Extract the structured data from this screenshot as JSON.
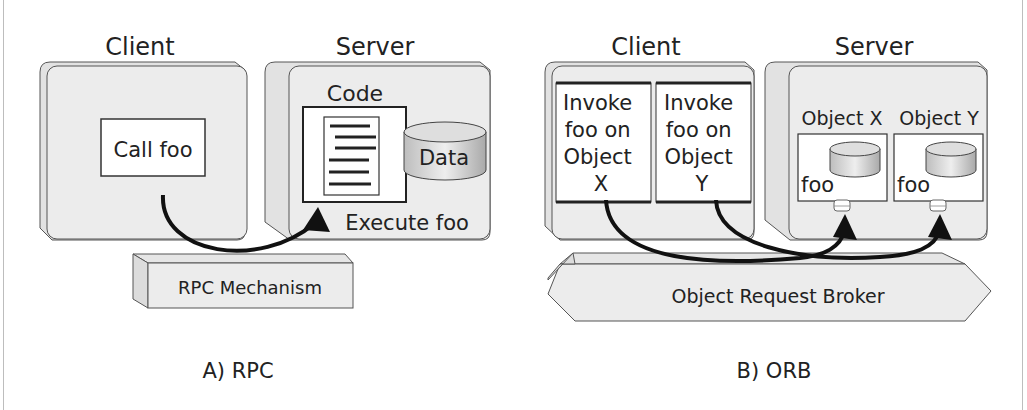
{
  "diagram": {
    "rpc": {
      "caption": "A) RPC",
      "client": {
        "title": "Client",
        "call_box": "Call foo"
      },
      "server": {
        "title": "Server",
        "code_label": "Code",
        "data_label": "Data",
        "execute_label": "Execute foo"
      },
      "mechanism": "RPC Mechanism"
    },
    "orb": {
      "caption": "B) ORB",
      "client": {
        "title": "Client",
        "invoke_x": [
          "Invoke",
          "foo on",
          "Object",
          "X"
        ],
        "invoke_y": [
          "Invoke",
          "foo on",
          "Object",
          "Y"
        ]
      },
      "server": {
        "title": "Server",
        "object_x": {
          "title": "Object X",
          "method": "foo"
        },
        "object_y": {
          "title": "Object Y",
          "method": "foo"
        }
      },
      "broker": "Object Request Broker"
    }
  },
  "colors": {
    "box_fill": "#ececec",
    "box_stroke": "#555555",
    "inner_fill": "#ffffff",
    "arrow": "#111111"
  }
}
